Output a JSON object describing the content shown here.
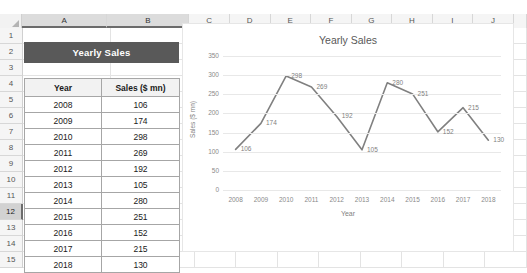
{
  "spreadsheet": {
    "columns": [
      "A",
      "B",
      "C",
      "D",
      "E",
      "F",
      "G",
      "H",
      "I",
      "J"
    ],
    "selected_columns": [
      "A",
      "B"
    ],
    "rows": [
      "1",
      "2",
      "3",
      "4",
      "5",
      "6",
      "7",
      "8",
      "9",
      "10",
      "11",
      "12",
      "13",
      "14",
      "15"
    ],
    "selected_row": "12",
    "title_cell": "Yearly Sales",
    "table": {
      "headers": [
        "Year",
        "Sales ($ mn)"
      ],
      "rows": [
        [
          "2008",
          "106"
        ],
        [
          "2009",
          "174"
        ],
        [
          "2010",
          "298"
        ],
        [
          "2011",
          "269"
        ],
        [
          "2012",
          "192"
        ],
        [
          "2013",
          "105"
        ],
        [
          "2014",
          "280"
        ],
        [
          "2015",
          "251"
        ],
        [
          "2016",
          "152"
        ],
        [
          "2017",
          "215"
        ],
        [
          "2018",
          "130"
        ]
      ]
    },
    "colors": {
      "title_fill": "#595959",
      "title_text": "#ffffff",
      "header_fill": "#f2f2f2",
      "border": "#a6a6a6"
    }
  },
  "chart_data": {
    "type": "line",
    "title": "Yearly Sales",
    "xlabel": "Year",
    "ylabel": "Sales ($ mn)",
    "categories": [
      "2008",
      "2009",
      "2010",
      "2011",
      "2012",
      "2013",
      "2014",
      "2015",
      "2016",
      "2017",
      "2018"
    ],
    "values": [
      106,
      174,
      298,
      269,
      192,
      105,
      280,
      251,
      152,
      215,
      130
    ],
    "data_labels": [
      "106",
      "174",
      "298",
      "269",
      "192",
      "105",
      "280",
      "251",
      "152",
      "215",
      "130"
    ],
    "yticks": [
      "0",
      "50",
      "100",
      "150",
      "200",
      "250",
      "300",
      "350"
    ],
    "ylim": [
      0,
      350
    ],
    "grid": true,
    "legend": false,
    "series_color": "#808080",
    "line_width": 1.6
  }
}
